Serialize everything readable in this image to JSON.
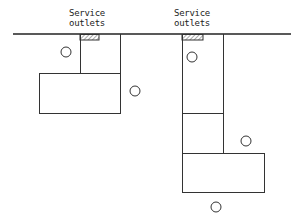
{
  "labels": {
    "outlet_left_line1": "Service",
    "outlet_left_line2": "outlets",
    "outlet_right_line1": "Service",
    "outlet_right_line2": "outlets"
  },
  "diagram": {
    "wall_line": {
      "x1": 13,
      "x2": 291,
      "y": 34
    },
    "outlets": [
      {
        "name": "left-outlet",
        "x": 80,
        "y": 34,
        "w": 19,
        "h": 6
      },
      {
        "name": "right-outlet",
        "x": 182,
        "y": 34,
        "w": 21,
        "h": 6
      }
    ],
    "layouts": [
      {
        "name": "left-layout",
        "narrow": {
          "x": 80,
          "y": 34,
          "w": 40,
          "h": 39
        },
        "wide": {
          "x": 39,
          "y": 73,
          "w": 82,
          "h": 40
        }
      },
      {
        "name": "right-layout",
        "narrow": {
          "x": 182,
          "y": 34,
          "w": 42,
          "h": 119,
          "divider_y": 113
        },
        "wide": {
          "x": 182,
          "y": 153,
          "w": 82,
          "h": 39
        }
      }
    ],
    "circles": [
      {
        "cx": 66,
        "cy": 52
      },
      {
        "cx": 135,
        "cy": 91
      },
      {
        "cx": 192,
        "cy": 57
      },
      {
        "cx": 246,
        "cy": 141
      },
      {
        "cx": 216,
        "cy": 207
      }
    ],
    "stroke_color": "#333333"
  }
}
